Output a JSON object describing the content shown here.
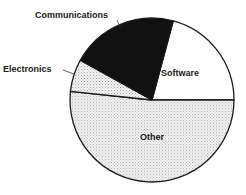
{
  "chart_data": {
    "type": "pie",
    "title": "",
    "title_note": "title partially cropped off top edge; not legible",
    "start_angle_deg_clockwise_from_top": 15,
    "direction": "clockwise",
    "slices": [
      {
        "label": "Software",
        "value": 20.8,
        "start": 15,
        "end": 90,
        "fill": "#ffffff",
        "pattern": "none",
        "label_pos": [
          180,
          76
        ]
      },
      {
        "label": "Other",
        "value": 51.7,
        "start": 90,
        "end": 276,
        "fill": "#e4e4e4",
        "pattern": "stipple",
        "label_pos": [
          152,
          140
        ]
      },
      {
        "label": "Electronics",
        "value": 6.4,
        "start": 276,
        "end": 299,
        "fill": "#ececec",
        "pattern": "dots",
        "label_pos": [
          3,
          72
        ],
        "external": true,
        "leader": [
          [
            63,
            70
          ],
          [
            74,
            74
          ]
        ]
      },
      {
        "label": "Communications",
        "value": 21.1,
        "start": 299,
        "end": 375,
        "fill": "#111111",
        "pattern": "solid",
        "label_pos": [
          35,
          18
        ],
        "external": true,
        "leader": [
          [
            117,
            20
          ],
          [
            120,
            27
          ]
        ]
      }
    ],
    "center": [
      152,
      100
    ],
    "radius": 82,
    "units": "percent (estimated from slice angles)",
    "legend": "none (direct labels)"
  }
}
